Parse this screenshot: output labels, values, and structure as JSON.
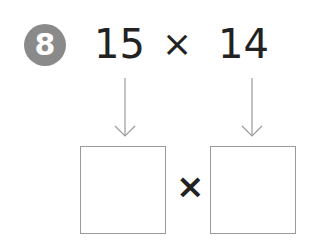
{
  "problem": {
    "number": "8",
    "factor_a": "15",
    "operator": "×",
    "factor_b": "14",
    "answer_operator": "×",
    "boxes": [
      "",
      ""
    ]
  },
  "colors": {
    "badge": "#8a8a8a",
    "text": "#222222",
    "lines": "#9a9a9a"
  }
}
